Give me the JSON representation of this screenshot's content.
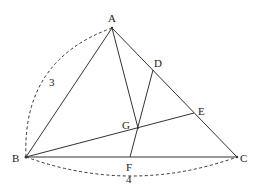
{
  "diagram": {
    "type": "triangle-geometry",
    "points": {
      "A": {
        "label": "A",
        "x": 112,
        "y": 28
      },
      "B": {
        "label": "B",
        "x": 26,
        "y": 157
      },
      "C": {
        "label": "C",
        "x": 237,
        "y": 157
      },
      "D": {
        "label": "D",
        "x": 153,
        "y": 70
      },
      "E": {
        "label": "E",
        "x": 194,
        "y": 113
      },
      "F": {
        "label": "F",
        "x": 130,
        "y": 157
      },
      "G": {
        "label": "G",
        "x": 138,
        "y": 128
      }
    },
    "segments": [
      [
        "A",
        "B"
      ],
      [
        "A",
        "C"
      ],
      [
        "B",
        "C"
      ],
      [
        "A",
        "G"
      ],
      [
        "D",
        "F"
      ],
      [
        "B",
        "E"
      ]
    ],
    "measurements": {
      "AB": {
        "label": "3",
        "style": "dashed-arc"
      },
      "BC": {
        "label": "4",
        "style": "dashed-arc"
      }
    }
  }
}
